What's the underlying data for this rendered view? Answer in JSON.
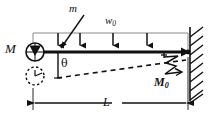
{
  "figure": {
    "type": "engineering-free-body-diagram",
    "background_color": "#ffffff",
    "line_color": "#111111",
    "thin_line_color": "#8a8a8a",
    "width": 217,
    "height": 122
  },
  "labels": {
    "mass_M": "M",
    "mass_m": "m",
    "distributed_load": "w",
    "distributed_load_sub": "0",
    "angle_theta": "θ",
    "moment_M0": "M",
    "moment_M0_sub": "0",
    "length_L": "L"
  },
  "geometry": {
    "beam": {
      "x1": 33,
      "y1": 52,
      "x2": 188,
      "y2": 52,
      "thickness": 2.6
    },
    "load_box_top": {
      "x1": 33,
      "y1": 33,
      "x2": 188,
      "y2": 33
    },
    "load_arrows_x": [
      58,
      80,
      113,
      147
    ],
    "load_arrow_top_y": 33,
    "load_arrow_bottom_y": 51,
    "support_left_circle": {
      "cx": 35,
      "cy": 52,
      "r": 9
    },
    "support_left_circle_dashed": {
      "cx": 35,
      "cy": 76,
      "r": 9
    },
    "support_right_pin": {
      "x": 188,
      "y": 52
    },
    "wall": {
      "x": 190,
      "y_top": 28,
      "y_bottom": 100,
      "hatch_count": 9
    },
    "deflection_line": {
      "x1": 58,
      "y1": 77,
      "x2": 185,
      "y2": 60,
      "dash": "5,4"
    },
    "theta_vertical": {
      "x": 58,
      "y1": 54,
      "y2": 78
    },
    "dimension_line": {
      "x1": 33,
      "y": 103,
      "x2": 188
    },
    "pointer_m": {
      "x1": 84,
      "y1": 14,
      "x2": 59,
      "y2": 50
    }
  },
  "annotations": {
    "left_support_kind": "pin-with-mass-circle",
    "right_support_kind": "pin-on-hatched-wall",
    "load_kind": "uniform-distributed-downward",
    "moment_kind": "applied-end-moment-curved-arrow",
    "deflection_kind": "dashed-deflected-shape"
  }
}
